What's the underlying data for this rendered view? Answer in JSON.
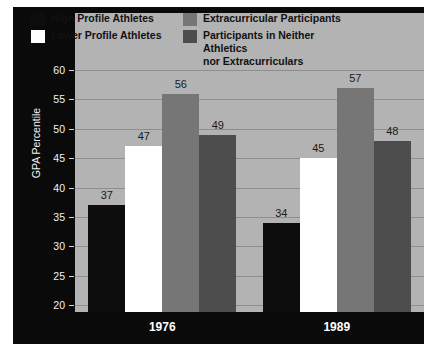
{
  "chart_data": {
    "type": "bar",
    "title": "",
    "xlabel": "",
    "ylabel": "GPA Percentile",
    "categories": [
      "1976",
      "1989"
    ],
    "ylim": [
      20,
      60
    ],
    "yticks": [
      20,
      25,
      30,
      35,
      40,
      45,
      50,
      55,
      60
    ],
    "ytick_labels": [
      "20",
      "25",
      "30",
      "35",
      "40",
      "45",
      "50",
      "55",
      "60"
    ],
    "grid": true,
    "legend_position": "top",
    "series": [
      {
        "name": "High Profile Athletes",
        "color": "#0d0d0d",
        "values": [
          37,
          34
        ],
        "labels": [
          "37",
          "34"
        ]
      },
      {
        "name": "Lower Profile Athletes",
        "color": "#ffffff",
        "values": [
          47,
          45
        ],
        "labels": [
          "47",
          "45"
        ]
      },
      {
        "name": "Extracurricular Participants",
        "color": "#767676",
        "values": [
          56,
          57
        ],
        "labels": [
          "56",
          "57"
        ]
      },
      {
        "name": "Participants in Neither Athletics\nnor Extracurriculars",
        "color": "#4d4d4d",
        "values": [
          49,
          48
        ],
        "labels": [
          "49",
          "48"
        ]
      }
    ]
  },
  "colors": {
    "panel_background": "#b3b3b3",
    "figure_background": "#0a0a0a",
    "gridline": "#8e8e8e",
    "axis_text": "#f2f2f2",
    "value_text": "#1a1a1a"
  }
}
